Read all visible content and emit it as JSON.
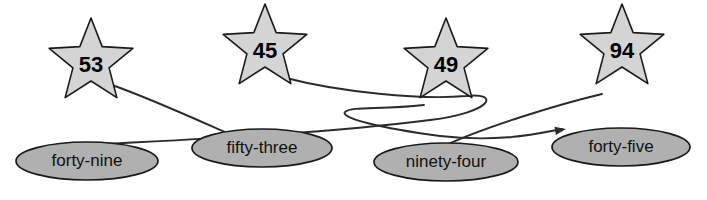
{
  "diagram": {
    "type": "directed-graph",
    "background_color": "#ffffff",
    "star_fill_color": "#d4d4d4",
    "ellipse_fill_color": "#b0b0b0",
    "stroke_color": "#1a1a1a",
    "edge_color": "#2b2b2b",
    "star_nodes": [
      {
        "id": "star-53",
        "label": "53",
        "cx": 91,
        "cy": 62,
        "r_outer": 44,
        "r_inner": 19,
        "rotation": 0
      },
      {
        "id": "star-45",
        "label": "45",
        "cx": 265,
        "cy": 48,
        "r_outer": 44,
        "r_inner": 19,
        "rotation": 0
      },
      {
        "id": "star-49",
        "label": "49",
        "cx": 446,
        "cy": 62,
        "r_outer": 44,
        "r_inner": 19,
        "rotation": 0
      },
      {
        "id": "star-94",
        "label": "94",
        "cx": 622,
        "cy": 48,
        "r_outer": 44,
        "r_inner": 19,
        "rotation": 0
      }
    ],
    "ellipse_nodes": [
      {
        "id": "ellipse-forty-nine",
        "label": "forty-nine",
        "cx": 87,
        "cy": 161,
        "rx": 71,
        "ry": 19
      },
      {
        "id": "ellipse-fifty-three",
        "label": "fifty-three",
        "cx": 262,
        "cy": 148,
        "rx": 70,
        "ry": 19
      },
      {
        "id": "ellipse-ninety-four",
        "label": "ninety-four",
        "cx": 446,
        "cy": 162,
        "rx": 72,
        "ry": 19
      },
      {
        "id": "ellipse-forty-five",
        "label": "forty-five",
        "cx": 621,
        "cy": 147,
        "rx": 69,
        "ry": 19
      }
    ],
    "edges": [
      {
        "id": "edge-53-to-fifty-three",
        "from": "star-53",
        "to": "ellipse-fifty-three",
        "path": "M 112 85 C 160 102, 210 126, 259 147",
        "arrow_x": 262,
        "arrow_y": 148,
        "arrow_angle": 24
      },
      {
        "id": "edge-45-to-forty-nine",
        "from": "star-45",
        "to": "ellipse-forty-nine",
        "path": "M 286 78 C 340 92, 420 100, 466 96 C 500 92, 494 112, 430 120 C 320 134, 180 140, 104 144",
        "arrow_x": 98,
        "arrow_y": 145,
        "arrow_angle": 186
      },
      {
        "id": "edge-49-to-forty-five",
        "from": "star-49",
        "to": "ellipse-forty-five",
        "path": "M 424 105 C 380 110, 352 106, 345 112 C 340 118, 380 128, 440 136 C 500 143, 540 133, 562 129",
        "arrow_x": 566,
        "arrow_y": 129,
        "arrow_angle": -10
      },
      {
        "id": "edge-94-to-ninety-four",
        "from": "star-94",
        "to": "ellipse-ninety-four",
        "path": "M 602 94 C 560 104, 480 128, 440 148 C 420 157, 410 160, 396 163",
        "arrow_x": 392,
        "arrow_y": 164,
        "arrow_angle": 168
      }
    ]
  }
}
